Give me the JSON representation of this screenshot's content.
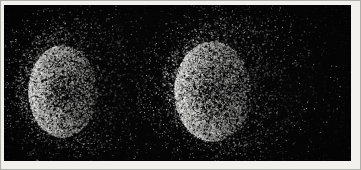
{
  "figure": {
    "kind": "speckle-blob-pair",
    "description": "Two grainy speckled luminous blobs on a black field, framed by a light scan border",
    "canvas": {
      "width": 361,
      "height": 170
    },
    "frame": {
      "name": "scan-border",
      "color": "#f2f1ee",
      "edge_line_color": "#78787600",
      "inset_left": 4,
      "inset_top": 5,
      "inset_right": 10,
      "inset_bottom": 9
    },
    "plate": {
      "name": "black-plate",
      "background_color": "#050506",
      "left": 4,
      "top": 5,
      "width": 347,
      "height": 156
    }
  },
  "chart_data": {
    "type": "scatter",
    "title": "",
    "subtitle": "",
    "xlabel": "",
    "ylabel": "",
    "grid": false,
    "legend": null,
    "background_color": "#050506",
    "point_color": "#ffffff",
    "xlim": [
      0,
      347
    ],
    "ylim": [
      0,
      156
    ],
    "annotations": [],
    "tick_labels": {
      "x": [],
      "y": []
    },
    "series": [
      {
        "name": "left-blob",
        "label": "Left speckle blob",
        "center_x": 82,
        "center_y": 80,
        "core_center_x": 58,
        "core_center_y": 86,
        "radius_x": 72,
        "radius_y": 68,
        "core_radius_x": 34,
        "core_radius_y": 46,
        "point_count": 9000,
        "core_point_count": 7200,
        "peak_brightness": 248,
        "halo_brightness": 150,
        "gradient_direction": "bright-left-to-dark-right",
        "edge_sharpness_left": 0.93,
        "edge_sharpness_right": 0.25
      },
      {
        "name": "right-blob",
        "label": "Right speckle blob",
        "center_x": 235,
        "center_y": 80,
        "core_center_x": 208,
        "core_center_y": 86,
        "radius_x": 78,
        "radius_y": 70,
        "core_radius_x": 38,
        "core_radius_y": 50,
        "point_count": 11000,
        "core_point_count": 8600,
        "peak_brightness": 252,
        "halo_brightness": 165,
        "gradient_direction": "bright-left-to-dark-right",
        "edge_sharpness_left": 0.96,
        "edge_sharpness_right": 0.28
      }
    ]
  }
}
